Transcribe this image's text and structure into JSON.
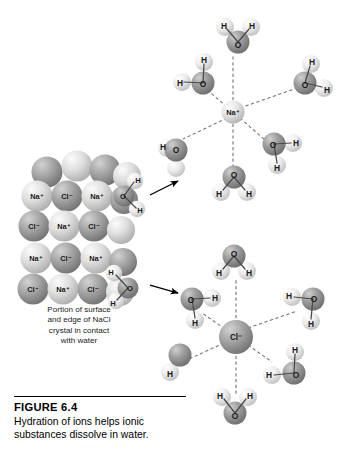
{
  "figure": {
    "number_label": "FIGURE  6.4",
    "caption": "Hydration of ions helps ionic substances dissolve in water."
  },
  "crystal": {
    "caption_lines": [
      "Portion of surface",
      "and edge of NaCl",
      "crystal in contact",
      "with water"
    ],
    "rows": [
      {
        "labels": [
          "Na⁺",
          "Cl⁻",
          "Na⁺"
        ]
      },
      {
        "labels": [
          "Cl⁻",
          "Na⁺",
          "Cl⁻"
        ]
      },
      {
        "labels": [
          "Na⁺",
          "Cl⁻",
          "Na⁺"
        ]
      },
      {
        "labels": [
          "Cl⁻",
          "Na⁺",
          "Cl⁻"
        ]
      }
    ],
    "edge_waters": [
      {
        "oxygen": "O",
        "hydrogens": [
          "H",
          "H"
        ]
      },
      {
        "oxygen": "O",
        "hydrogens": [
          "H",
          "H"
        ]
      }
    ]
  },
  "sodium_cluster": {
    "ion_label": "Na⁺",
    "waters": [
      {
        "oxygen": "O",
        "hydrogens": [
          "H",
          "H"
        ]
      },
      {
        "oxygen": "O",
        "hydrogens": [
          "H",
          "H"
        ]
      },
      {
        "oxygen": "O",
        "hydrogens": [
          "H",
          "H"
        ]
      },
      {
        "oxygen": "O",
        "hydrogens": [
          "H",
          "H"
        ]
      },
      {
        "oxygen": "O",
        "hydrogens": [
          "H",
          "H"
        ]
      },
      {
        "oxygen": "O",
        "hydrogens": [
          "H",
          "H"
        ]
      }
    ]
  },
  "chloride_cluster": {
    "ion_label": "Cl⁻",
    "waters": [
      {
        "oxygen": "O",
        "hydrogens": [
          "H",
          "H"
        ]
      },
      {
        "oxygen": "O",
        "hydrogens": [
          "H",
          "H"
        ]
      },
      {
        "oxygen": "O",
        "hydrogens": [
          "H",
          "H"
        ]
      },
      {
        "oxygen": "O",
        "hydrogens": [
          "H",
          "H"
        ]
      },
      {
        "oxygen": "O",
        "hydrogens": [
          "H",
          "H"
        ]
      },
      {
        "oxygen": "O",
        "hydrogens": [
          "H",
          "H"
        ]
      }
    ]
  },
  "colors": {
    "background": "#ffffff",
    "oxygen": "#8e8e8e",
    "hydrogen": "#e3e3e3",
    "sodium": "#d6d6d6",
    "chloride": "#9a9a9a",
    "text": "#1a1a1a",
    "bond": "#4a4a4a",
    "dashed_bond": "#6d6d6d"
  }
}
